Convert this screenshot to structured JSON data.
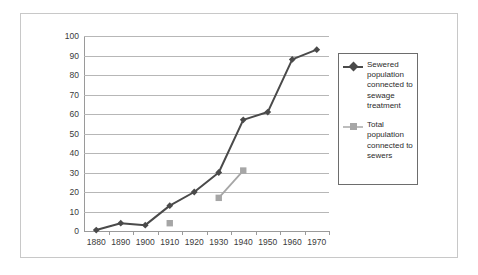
{
  "chart_data": {
    "type": "line",
    "title": "",
    "xlabel": "",
    "ylabel": "",
    "grid": true,
    "legend_position": "right",
    "xlim": [
      1875,
      1975
    ],
    "ylim": [
      0,
      100
    ],
    "yticks": [
      0,
      10,
      20,
      30,
      40,
      50,
      60,
      70,
      80,
      90,
      100
    ],
    "ytick_labels": [
      "0",
      "10",
      "20",
      "30",
      "40",
      "50",
      "60",
      "70",
      "80",
      "90",
      "100"
    ],
    "categories": [
      1880,
      1890,
      1900,
      1910,
      1920,
      1930,
      1940,
      1950,
      1960,
      1970
    ],
    "xtick_labels": [
      "1880",
      "1890",
      "1900",
      "1910",
      "1920",
      "1930",
      "1940",
      "1950",
      "1960",
      "1970"
    ],
    "series": [
      {
        "name": "Sewered population connected to sewage treatment",
        "color": "#4a4a4a",
        "marker": "diamond",
        "x": [
          1880,
          1890,
          1900,
          1910,
          1920,
          1930,
          1940,
          1950,
          1960,
          1970
        ],
        "values": [
          0.5,
          4,
          3,
          13,
          20,
          30,
          57,
          61,
          88,
          93
        ]
      },
      {
        "name": "Total population connected to sewers",
        "color": "#a6a6a6",
        "marker": "square",
        "x": [
          1910,
          1930,
          1940
        ],
        "values": [
          4,
          17,
          31
        ],
        "segments": [
          [
            1930,
            1940
          ]
        ]
      }
    ]
  },
  "legend": {
    "entries": [
      {
        "label": "Sewered population connected to sewage treatment",
        "color": "#4a4a4a",
        "marker": "diamond"
      },
      {
        "label": "Total population connected to sewers",
        "color": "#a6a6a6",
        "marker": "square"
      }
    ]
  }
}
